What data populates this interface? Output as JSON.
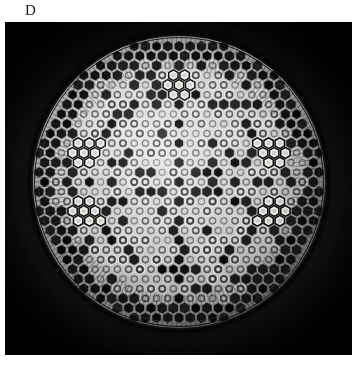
{
  "figure": {
    "panel_label": "D",
    "caption_text": "",
    "background_color": "#ffffff"
  },
  "micrograph": {
    "subject": "centric diatom frustule",
    "modality": "light micrograph",
    "field_background_color": "#000000",
    "halo_color": "#5c5c5c",
    "panel": {
      "x": 5,
      "y": 22,
      "width": 347,
      "height": 333
    }
  },
  "specimen": {
    "name": "diatom-valve",
    "shape": "circular disc",
    "center": {
      "x": 174,
      "y": 160
    },
    "radius": 148,
    "rim_color": "#060606",
    "silica_color": "#b9b9b9",
    "areola_dark_color": "#0a0a0a",
    "areola_light_color": "#ededed",
    "lattice": "hexagonal honeycomb of areolae",
    "pattern": "radiating star of dark areolae with five bright clusters",
    "bright_clusters": 5,
    "lattice_rings": 15,
    "areola_spacing_px": 11.2
  },
  "chart_data": {
    "type": "scatter",
    "title": "",
    "xlabel": "",
    "ylabel": "",
    "lattice": {
      "type": "hex",
      "center_x": 148,
      "center_y": 148,
      "spacing": 11.2,
      "rings": 15,
      "valve_radius": 146
    },
    "bright_clusters": [
      {
        "angle_deg": 90,
        "radius": 96,
        "count": 7,
        "label": "top-cluster"
      },
      {
        "angle_deg": 18,
        "radius": 96,
        "count": 7,
        "label": "upper-right-cluster"
      },
      {
        "angle_deg": 342,
        "radius": 96,
        "count": 6,
        "label": "lower-right-cluster"
      },
      {
        "angle_deg": 198,
        "radius": 96,
        "count": 6,
        "label": "lower-left-cluster"
      },
      {
        "angle_deg": 162,
        "radius": 96,
        "count": 7,
        "label": "upper-left-cluster"
      }
    ],
    "star_arms": [
      {
        "angle_deg": 90,
        "label": "arm-n"
      },
      {
        "angle_deg": 18,
        "label": "arm-ne"
      },
      {
        "angle_deg": 342,
        "label": "arm-se"
      },
      {
        "angle_deg": 270,
        "label": "arm-s"
      },
      {
        "angle_deg": 198,
        "label": "arm-sw"
      },
      {
        "angle_deg": 162,
        "label": "arm-nw"
      }
    ]
  }
}
